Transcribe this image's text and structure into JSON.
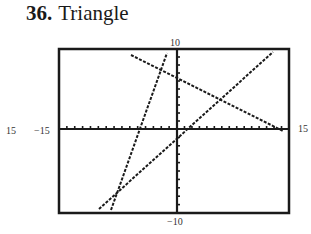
{
  "heading": {
    "number": "36.",
    "title": "Triangle"
  },
  "window": {
    "xmin_label": "−15",
    "xmax_label": "15",
    "ymax_label": "10",
    "ymin_label": "−10",
    "outer_left_label": "15"
  },
  "graph": {
    "box": {
      "left": 59,
      "top": 49,
      "right": 289,
      "bottom": 213
    },
    "origin_px": {
      "x": 177,
      "y": 129
    },
    "lines": [
      {
        "name": "steep-line",
        "x1": 111,
        "y1": 210,
        "x2": 167,
        "y2": 53
      },
      {
        "name": "rising-line",
        "x1": 99,
        "y1": 209,
        "x2": 273,
        "y2": 52
      },
      {
        "name": "falling-line",
        "x1": 131,
        "y1": 55,
        "x2": 283,
        "y2": 131
      }
    ]
  }
}
